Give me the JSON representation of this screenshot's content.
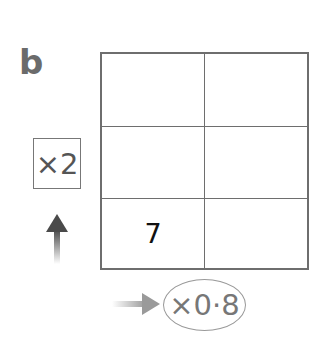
{
  "panel_label": "b",
  "grid": {
    "rows": 3,
    "columns": 2,
    "cells": [
      [
        "",
        ""
      ],
      [
        "",
        ""
      ],
      [
        "7",
        ""
      ]
    ]
  },
  "vertical_multiplier": {
    "label": "×2",
    "arrow_direction": "up"
  },
  "horizontal_multiplier": {
    "label": "×0·8",
    "arrow_direction": "right"
  },
  "colors": {
    "grid_line": "#6e6e6e",
    "label_gray": "#6b6b6b",
    "arrow_dark": "#4a4a4a",
    "arrow_light": "#9a9a9a"
  }
}
